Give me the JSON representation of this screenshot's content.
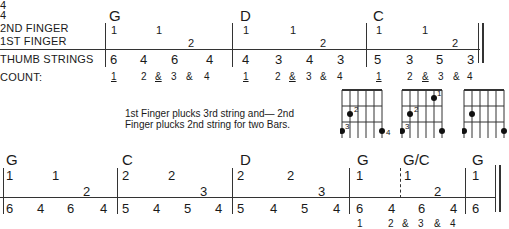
{
  "time_signature": {
    "top": "4",
    "bottom": "4"
  },
  "row_labels": {
    "second_finger": "2ND FINGER",
    "first_finger": "1ST FINGER",
    "thumb": "THUMB STRINGS",
    "count": "COUNT:"
  },
  "top_staff": {
    "bars": [
      {
        "chord": "G",
        "second": [
          "1",
          "1"
        ],
        "first": [
          "2"
        ],
        "thumb": [
          "6",
          "4",
          "6",
          "4"
        ],
        "count": [
          "1",
          "2",
          "&",
          "3",
          "&",
          "4"
        ]
      },
      {
        "chord": "D",
        "second": [
          "1",
          "1"
        ],
        "first": [
          "2"
        ],
        "thumb": [
          "4",
          "3",
          "4",
          "3"
        ],
        "count": [
          "1",
          "2",
          "&",
          "3",
          "&",
          "4"
        ]
      },
      {
        "chord": "C",
        "second": [
          "1",
          "1"
        ],
        "first": [
          "2"
        ],
        "thumb": [
          "5",
          "3",
          "5",
          "3"
        ],
        "count": [
          "1",
          "2",
          "&",
          "3",
          "&",
          "4"
        ]
      }
    ]
  },
  "note_text": "1st Finger plucks 3rd string and— 2nd Finger plucks 2nd string for two Bars.",
  "diagrams": [
    {
      "chord": "G",
      "fingers": [
        "2",
        "3",
        "4"
      ]
    },
    {
      "chord": "G/C",
      "fingers": [
        "1",
        "2",
        "3"
      ]
    },
    {
      "chord": "G",
      "fingers": []
    }
  ],
  "bottom_staff": {
    "bars": [
      {
        "chord": "G",
        "upper": [
          "1",
          "1"
        ],
        "lower": [
          "2"
        ],
        "thumb": [
          "6",
          "4",
          "6",
          "4"
        ]
      },
      {
        "chord": "C",
        "upper": [
          "2",
          "2"
        ],
        "lower": [
          "3"
        ],
        "thumb": [
          "5",
          "4",
          "5",
          "4"
        ]
      },
      {
        "chord": "D",
        "upper": [
          "2",
          "2"
        ],
        "lower": [
          "3"
        ],
        "thumb": [
          "5",
          "4",
          "5",
          "4"
        ]
      },
      {
        "chord": "G",
        "upper": [
          "1"
        ],
        "lower": [],
        "thumb": [
          "6",
          "4"
        ]
      },
      {
        "chord": "G/C",
        "upper": [
          "1"
        ],
        "lower": [
          "2"
        ],
        "thumb": [
          "6",
          "4"
        ]
      },
      {
        "chord": "G",
        "upper": [
          "1"
        ],
        "lower": [],
        "thumb": [
          "6"
        ]
      }
    ],
    "count": [
      "1",
      "2",
      "&",
      "3",
      "&",
      "4"
    ]
  }
}
